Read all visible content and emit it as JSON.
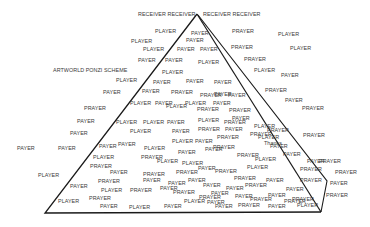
{
  "diagram": {
    "title": "ARTWORLD PONZI SCHEME",
    "line_color": "#1a1a1a",
    "text_color": "#3a3a3a",
    "shape": {
      "apex": [
        197,
        14
      ],
      "base_left": [
        45,
        213
      ],
      "base_right": [
        321,
        212
      ],
      "outer_right_knee": [
        327,
        181
      ]
    },
    "words": [
      {
        "t": "RECEIVER RECEIVER",
        "x": 138,
        "y": 14
      },
      {
        "t": "RECEIVER RECEIVER",
        "x": 203,
        "y": 14
      },
      {
        "t": "PLAYER",
        "x": 155,
        "y": 31
      },
      {
        "t": "PAYER",
        "x": 191,
        "y": 33
      },
      {
        "t": "PRAYER",
        "x": 232,
        "y": 31
      },
      {
        "t": "PLAYER",
        "x": 278,
        "y": 34
      },
      {
        "t": "PLAYER",
        "x": 131,
        "y": 41
      },
      {
        "t": "PAYER",
        "x": 186,
        "y": 40
      },
      {
        "t": "PLAYER",
        "x": 143,
        "y": 49
      },
      {
        "t": "PAYER",
        "x": 177,
        "y": 49
      },
      {
        "t": "PAYER",
        "x": 200,
        "y": 49
      },
      {
        "t": "PRAYER",
        "x": 231,
        "y": 47
      },
      {
        "t": "PLAYER",
        "x": 290,
        "y": 48
      },
      {
        "t": "PAYER",
        "x": 138,
        "y": 60
      },
      {
        "t": "PAYER",
        "x": 165,
        "y": 60
      },
      {
        "t": "PLAYER",
        "x": 198,
        "y": 62
      },
      {
        "t": "PRAYER",
        "x": 244,
        "y": 59
      },
      {
        "t": "PLAYER",
        "x": 254,
        "y": 70
      },
      {
        "t": "PAYER",
        "x": 281,
        "y": 75
      },
      {
        "t": "ARTWORLD PONZI SCHEME",
        "x": 53,
        "y": 70,
        "title": true
      },
      {
        "t": "PLAYER",
        "x": 162,
        "y": 72
      },
      {
        "t": "PLAYER",
        "x": 116,
        "y": 80
      },
      {
        "t": "PAYER",
        "x": 153,
        "y": 82
      },
      {
        "t": "PAYER",
        "x": 186,
        "y": 81
      },
      {
        "t": "PAYER",
        "x": 214,
        "y": 82
      },
      {
        "t": "PRAYER",
        "x": 265,
        "y": 90
      },
      {
        "t": "PAYER",
        "x": 285,
        "y": 100
      },
      {
        "t": "PAYER",
        "x": 103,
        "y": 92
      },
      {
        "t": "PAYER",
        "x": 142,
        "y": 91
      },
      {
        "t": "PRAYER",
        "x": 171,
        "y": 92
      },
      {
        "t": "PRAYER",
        "x": 200,
        "y": 95
      },
      {
        "t": "PAYER",
        "x": 214,
        "y": 94
      },
      {
        "t": "PAYER",
        "x": 228,
        "y": 95
      },
      {
        "t": "PRAYER",
        "x": 84,
        "y": 108
      },
      {
        "t": "PLAYER",
        "x": 130,
        "y": 103
      },
      {
        "t": "PAYER",
        "x": 155,
        "y": 103
      },
      {
        "t": "PLAYER",
        "x": 185,
        "y": 103
      },
      {
        "t": "PAYER",
        "x": 213,
        "y": 103
      },
      {
        "t": "PRAYER",
        "x": 229,
        "y": 110
      },
      {
        "t": "PRAYER",
        "x": 302,
        "y": 108
      },
      {
        "t": "PLAYER",
        "x": 166,
        "y": 106
      },
      {
        "t": "PRAYER",
        "x": 197,
        "y": 109
      },
      {
        "t": "PAYER",
        "x": 232,
        "y": 118
      },
      {
        "t": "PAYER",
        "x": 77,
        "y": 121
      },
      {
        "t": "PLAYER",
        "x": 116,
        "y": 122
      },
      {
        "t": "PLAYER",
        "x": 143,
        "y": 122
      },
      {
        "t": "PAYER",
        "x": 167,
        "y": 122
      },
      {
        "t": "PLAYER",
        "x": 198,
        "y": 120
      },
      {
        "t": "PRAYER",
        "x": 224,
        "y": 122
      },
      {
        "t": "PLAYER",
        "x": 254,
        "y": 126
      },
      {
        "t": "PRAYER",
        "x": 267,
        "y": 130
      },
      {
        "t": "PAYER",
        "x": 70,
        "y": 133
      },
      {
        "t": "PLAYER",
        "x": 130,
        "y": 131
      },
      {
        "t": "PAYER",
        "x": 172,
        "y": 131
      },
      {
        "t": "PRAYER",
        "x": 198,
        "y": 129
      },
      {
        "t": "PAYER",
        "x": 225,
        "y": 129
      },
      {
        "t": "PRAYER",
        "x": 217,
        "y": 137
      },
      {
        "t": "PRAYER",
        "x": 250,
        "y": 134
      },
      {
        "t": "PLAYER",
        "x": 258,
        "y": 137
      },
      {
        "t": "Thanks",
        "x": 264,
        "y": 143
      },
      {
        "t": "PAYER",
        "x": 270,
        "y": 146
      },
      {
        "t": "PRAYER",
        "x": 303,
        "y": 135
      },
      {
        "t": "PAYER",
        "x": 283,
        "y": 154
      },
      {
        "t": "PAYER",
        "x": 17,
        "y": 148
      },
      {
        "t": "PAYER",
        "x": 58,
        "y": 148
      },
      {
        "t": "PAYER",
        "x": 99,
        "y": 146
      },
      {
        "t": "PLAYER",
        "x": 93,
        "y": 157
      },
      {
        "t": "PRAYER",
        "x": 90,
        "y": 166
      },
      {
        "t": "PAYER",
        "x": 118,
        "y": 144
      },
      {
        "t": "PLAYER",
        "x": 144,
        "y": 148
      },
      {
        "t": "PRAYER",
        "x": 141,
        "y": 157
      },
      {
        "t": "PLAYER",
        "x": 157,
        "y": 161
      },
      {
        "t": "PLAYER",
        "x": 172,
        "y": 141
      },
      {
        "t": "PAYER",
        "x": 195,
        "y": 141
      },
      {
        "t": "PAYER",
        "x": 178,
        "y": 152
      },
      {
        "t": "PAYER",
        "x": 205,
        "y": 149
      },
      {
        "t": "PRAYER",
        "x": 213,
        "y": 147
      },
      {
        "t": "PRAYER",
        "x": 237,
        "y": 155
      },
      {
        "t": "PLAYER",
        "x": 255,
        "y": 159
      },
      {
        "t": "PAYER",
        "x": 307,
        "y": 161
      },
      {
        "t": "PRAYER",
        "x": 319,
        "y": 161
      },
      {
        "t": "PRAYER",
        "x": 300,
        "y": 169
      },
      {
        "t": "PLAYER",
        "x": 38,
        "y": 175
      },
      {
        "t": "PAYER",
        "x": 110,
        "y": 172
      },
      {
        "t": "PRAYER",
        "x": 143,
        "y": 174
      },
      {
        "t": "PAYER",
        "x": 143,
        "y": 180
      },
      {
        "t": "PRAYER",
        "x": 176,
        "y": 172
      },
      {
        "t": "PAYER",
        "x": 198,
        "y": 168
      },
      {
        "t": "PLAYER",
        "x": 182,
        "y": 163
      },
      {
        "t": "PRAYER",
        "x": 215,
        "y": 171
      },
      {
        "t": "PLAYER",
        "x": 247,
        "y": 167
      },
      {
        "t": "PRAYER",
        "x": 234,
        "y": 178
      },
      {
        "t": "PAYER",
        "x": 266,
        "y": 180
      },
      {
        "t": "PRAYER",
        "x": 300,
        "y": 180
      },
      {
        "t": "PRAYER",
        "x": 335,
        "y": 172
      },
      {
        "t": "PAYER",
        "x": 330,
        "y": 183
      },
      {
        "t": "PAYER",
        "x": 188,
        "y": 180
      },
      {
        "t": "PAYER",
        "x": 70,
        "y": 186
      },
      {
        "t": "PRAYER",
        "x": 98,
        "y": 181
      },
      {
        "t": "PLAYER",
        "x": 101,
        "y": 190
      },
      {
        "t": "PRAYER",
        "x": 130,
        "y": 190
      },
      {
        "t": "PAYER",
        "x": 160,
        "y": 188
      },
      {
        "t": "PAYER",
        "x": 168,
        "y": 183
      },
      {
        "t": "PRAYER",
        "x": 173,
        "y": 192
      },
      {
        "t": "PAYER",
        "x": 203,
        "y": 185
      },
      {
        "t": "PAYER",
        "x": 226,
        "y": 188
      },
      {
        "t": "PRAYER",
        "x": 245,
        "y": 185
      },
      {
        "t": "PAYER",
        "x": 211,
        "y": 193
      },
      {
        "t": "PRAYER",
        "x": 199,
        "y": 197
      },
      {
        "t": "PAYER",
        "x": 235,
        "y": 196
      },
      {
        "t": "PRAYER",
        "x": 250,
        "y": 199
      },
      {
        "t": "PAYER",
        "x": 268,
        "y": 195
      },
      {
        "t": "PAYER",
        "x": 286,
        "y": 189
      },
      {
        "t": "PRAYER",
        "x": 292,
        "y": 199
      },
      {
        "t": "PRAYER",
        "x": 326,
        "y": 195
      },
      {
        "t": "PLAYER",
        "x": 58,
        "y": 201
      },
      {
        "t": "PRAYER",
        "x": 89,
        "y": 198
      },
      {
        "t": "PAYER",
        "x": 100,
        "y": 206
      },
      {
        "t": "PLAYER",
        "x": 129,
        "y": 207
      },
      {
        "t": "PAYER",
        "x": 164,
        "y": 206
      },
      {
        "t": "PAYER",
        "x": 215,
        "y": 206
      },
      {
        "t": "PAYER",
        "x": 268,
        "y": 206
      },
      {
        "t": "PRAYER",
        "x": 284,
        "y": 201
      },
      {
        "t": "PLAYER",
        "x": 297,
        "y": 205
      },
      {
        "t": "PLAYER",
        "x": 184,
        "y": 201
      },
      {
        "t": "PAYER",
        "x": 207,
        "y": 202
      },
      {
        "t": "PRAYER",
        "x": 238,
        "y": 205
      }
    ]
  }
}
